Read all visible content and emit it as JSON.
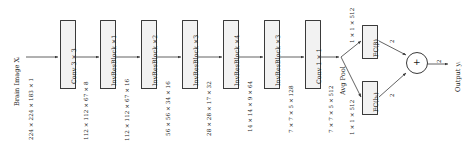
{
  "diagram": {
    "input": {
      "label": "Brain Image Xᵢ",
      "dims": "224 × 224 × 183 × 1"
    },
    "blocks": [
      {
        "label": "Conv 3 × 3",
        "out_dims": "112 × 112 × 67 × 8"
      },
      {
        "label": "InvResBlock ×1",
        "out_dims": "112 × 112 × 67 × 16"
      },
      {
        "label": "InvResBlock ×2",
        "out_dims": "56 × 56 × 34 × 16"
      },
      {
        "label": "InvResBlock ×3",
        "out_dims": "28 × 28 × 17 × 32"
      },
      {
        "label": "InvResBlock ×4",
        "out_dims": "14 × 14 × 9 × 64"
      },
      {
        "label": "InvResBlock ×3",
        "out_dims": "7 × 7 × 5 × 128"
      },
      {
        "label": "Conv 1 × 1",
        "out_dims": "7 × 7 × 5 × 512"
      }
    ],
    "pooling": {
      "label": "Avg Pool"
    },
    "branches": [
      {
        "in_dims": "1 × 1 × 512",
        "label": "FC(β)",
        "out_dims": "2"
      },
      {
        "in_dims": "1 × 1 × 512",
        "label": "FC(bᵢ)",
        "out_dims": "2"
      }
    ],
    "merge": {
      "operator": "+",
      "out_dims": "2"
    },
    "output": {
      "label": "Output yᵢ"
    },
    "colors": {
      "box_fill": "#f2f2f2",
      "box_stroke": "#3a3a3a",
      "text": "#1a1a1a",
      "wire": "#3a3a3a",
      "background": "#ffffff"
    }
  }
}
